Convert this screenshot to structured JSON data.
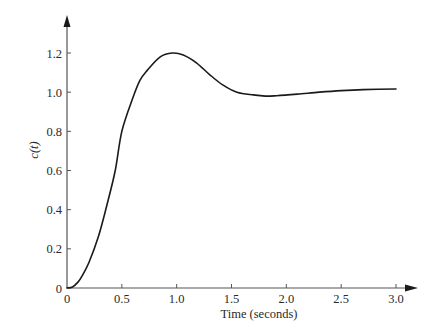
{
  "chart_data": {
    "type": "line",
    "title": "",
    "xlabel": "Time (seconds)",
    "ylabel": "c(t)",
    "xlim": [
      0,
      3.0
    ],
    "ylim": [
      0,
      1.2
    ],
    "grid": false,
    "legend": null,
    "x_ticks": [
      "0",
      "0.5",
      "1.0",
      "1.5",
      "2.0",
      "2.5",
      "3.0"
    ],
    "y_ticks": [
      "0",
      "0.2",
      "0.4",
      "0.6",
      "0.8",
      "1.0",
      "1.2"
    ],
    "series": [
      {
        "name": "c(t)",
        "color": "#1a1a1a",
        "x": [
          0,
          0.05,
          0.1,
          0.134,
          0.2,
          0.285,
          0.36,
          0.44,
          0.5,
          0.6,
          0.665,
          0.73,
          0.85,
          0.96,
          1.06,
          1.18,
          1.3,
          1.42,
          1.55,
          1.7,
          1.81,
          1.91,
          2.1,
          2.3,
          2.5,
          2.7,
          3.0
        ],
        "values": [
          0,
          0.005,
          0.03,
          0.058,
          0.13,
          0.26,
          0.415,
          0.6,
          0.8,
          0.97,
          1.06,
          1.11,
          1.18,
          1.2,
          1.19,
          1.15,
          1.09,
          1.037,
          1.0,
          0.986,
          0.98,
          0.982,
          0.99,
          1.0,
          1.008,
          1.013,
          1.016
        ]
      }
    ]
  }
}
